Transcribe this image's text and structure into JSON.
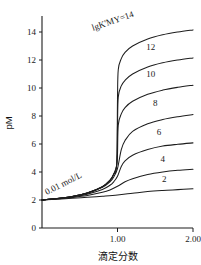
{
  "chart_data": {
    "type": "line",
    "title": "",
    "xlabel": "滴定分数",
    "ylabel": "pM",
    "xlim": [
      0,
      2.0
    ],
    "ylim": [
      0,
      15
    ],
    "grid": false,
    "legend_position": "inline-right-of-each-curve",
    "x_ticks": [
      {
        "value": 1.0,
        "label": "1.00"
      },
      {
        "value": 2.0,
        "label": "2.00"
      }
    ],
    "y_ticks": [
      {
        "value": 0,
        "label": "0"
      },
      {
        "value": 2,
        "label": "2"
      },
      {
        "value": 4,
        "label": "4"
      },
      {
        "value": 6,
        "label": "6"
      },
      {
        "value": 8,
        "label": "8"
      },
      {
        "value": 10,
        "label": "10"
      },
      {
        "value": 12,
        "label": "12"
      },
      {
        "value": 14,
        "label": "14"
      }
    ],
    "annotations": [
      {
        "name": "concentration",
        "text": "0.01 mol/L",
        "x": 0.3,
        "y": 3.0,
        "rotation": -27
      },
      {
        "name": "top-curve-label",
        "text": "lgK'MY=14",
        "x": 0.95,
        "y": 14.6,
        "rotation": -19
      }
    ],
    "series": [
      {
        "name": "lgK-14",
        "label": "14",
        "lgK": 14,
        "x": [
          0.0,
          0.2,
          0.4,
          0.6,
          0.8,
          0.9,
          0.95,
          0.99,
          1.0,
          1.01,
          1.05,
          1.1,
          1.2,
          1.4,
          1.6,
          1.8,
          2.0
        ],
        "y": [
          2.0,
          2.1,
          2.25,
          2.5,
          2.95,
          3.4,
          3.85,
          4.6,
          9.2,
          11.3,
          12.1,
          12.55,
          13.0,
          13.5,
          13.8,
          14.0,
          14.15
        ]
      },
      {
        "name": "lgK-12",
        "label": "12",
        "lgK": 12,
        "x": [
          0.0,
          0.2,
          0.4,
          0.6,
          0.8,
          0.9,
          0.95,
          0.99,
          1.0,
          1.01,
          1.05,
          1.1,
          1.2,
          1.4,
          1.6,
          1.8,
          2.0
        ],
        "y": [
          2.0,
          2.1,
          2.25,
          2.5,
          2.95,
          3.4,
          3.85,
          4.55,
          7.3,
          9.35,
          10.15,
          10.55,
          11.0,
          11.5,
          11.8,
          12.0,
          12.15
        ]
      },
      {
        "name": "lgK-10",
        "label": "10",
        "lgK": 10,
        "x": [
          0.0,
          0.2,
          0.4,
          0.6,
          0.8,
          0.9,
          0.95,
          0.99,
          1.0,
          1.01,
          1.05,
          1.1,
          1.2,
          1.4,
          1.6,
          1.8,
          2.0
        ],
        "y": [
          2.0,
          2.1,
          2.25,
          2.5,
          2.95,
          3.4,
          3.85,
          4.5,
          5.3,
          7.35,
          8.15,
          8.6,
          9.05,
          9.55,
          9.85,
          10.05,
          10.2
        ]
      },
      {
        "name": "lgK-8",
        "label": "8",
        "lgK": 8,
        "x": [
          0.0,
          0.2,
          0.4,
          0.6,
          0.8,
          0.9,
          0.95,
          1.0,
          1.05,
          1.1,
          1.2,
          1.4,
          1.6,
          1.8,
          2.0
        ],
        "y": [
          2.0,
          2.1,
          2.25,
          2.5,
          2.9,
          3.3,
          3.65,
          4.25,
          5.6,
          6.25,
          6.9,
          7.45,
          7.75,
          7.95,
          8.1
        ]
      },
      {
        "name": "lgK-6",
        "label": "6",
        "lgK": 6,
        "x": [
          0.0,
          0.2,
          0.4,
          0.6,
          0.8,
          0.9,
          0.95,
          1.0,
          1.05,
          1.1,
          1.2,
          1.4,
          1.6,
          1.8,
          2.0
        ],
        "y": [
          2.0,
          2.1,
          2.22,
          2.42,
          2.75,
          3.05,
          3.3,
          3.7,
          4.4,
          4.8,
          5.2,
          5.6,
          5.85,
          5.98,
          6.08
        ]
      },
      {
        "name": "lgK-4",
        "label": "4",
        "lgK": 4,
        "x": [
          0.0,
          0.2,
          0.4,
          0.6,
          0.8,
          0.9,
          1.0,
          1.1,
          1.2,
          1.4,
          1.6,
          1.8,
          2.0
        ],
        "y": [
          2.0,
          2.08,
          2.18,
          2.32,
          2.55,
          2.72,
          2.98,
          3.3,
          3.52,
          3.82,
          4.0,
          4.12,
          4.2
        ]
      },
      {
        "name": "lgK-2",
        "label": "2",
        "lgK": 2,
        "x": [
          0.0,
          0.2,
          0.4,
          0.6,
          0.8,
          1.0,
          1.2,
          1.4,
          1.6,
          1.8,
          2.0
        ],
        "y": [
          2.0,
          2.06,
          2.12,
          2.19,
          2.27,
          2.36,
          2.48,
          2.6,
          2.68,
          2.74,
          2.8
        ]
      }
    ],
    "curve_labels": [
      {
        "series": "lgK-12",
        "text": "12",
        "x": 1.44,
        "y": 12.75
      },
      {
        "series": "lgK-10",
        "text": "10",
        "x": 1.44,
        "y": 10.8
      },
      {
        "series": "lgK-8",
        "text": "8",
        "x": 1.5,
        "y": 8.7
      },
      {
        "series": "lgK-6",
        "text": "6",
        "x": 1.55,
        "y": 6.65
      },
      {
        "series": "lgK-4",
        "text": "4",
        "x": 1.6,
        "y": 4.72
      },
      {
        "series": "lgK-2",
        "text": "2",
        "x": 1.62,
        "y": 3.28
      }
    ]
  },
  "colors": {
    "background": "#ffffff",
    "ink": "#1d1d1d",
    "curve": "#1d1d1d"
  }
}
